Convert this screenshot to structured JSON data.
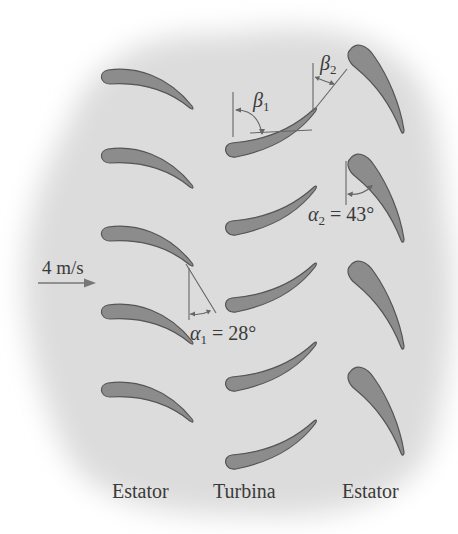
{
  "diagram": {
    "type": "turbine-stage-cascade",
    "colors": {
      "background_blob": "#dcdcdc",
      "blade_fill": "#8c8c8c",
      "blade_stroke": "#555555",
      "line": "#666666",
      "text": "#3a3a3a"
    },
    "inlet": {
      "speed_label": "4 m/s"
    },
    "columns": [
      {
        "id": "stator-left",
        "label": "Estator",
        "blade_count": 5
      },
      {
        "id": "turbine",
        "label": "Turbina",
        "blade_count": 5
      },
      {
        "id": "stator-right",
        "label": "Estator",
        "blade_count": 4
      }
    ],
    "angles": {
      "alpha1": {
        "symbol": "α",
        "subscript": "1",
        "text": " = 28°",
        "value_deg": 28
      },
      "alpha2": {
        "symbol": "α",
        "subscript": "2",
        "text": " = 43°",
        "value_deg": 43
      },
      "beta1": {
        "symbol": "β",
        "subscript": "1"
      },
      "beta2": {
        "symbol": "β",
        "subscript": "2"
      }
    }
  }
}
